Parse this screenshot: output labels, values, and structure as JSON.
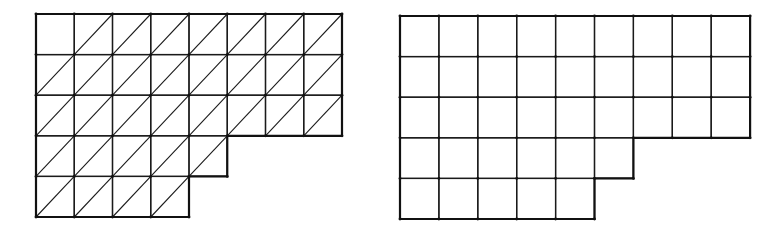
{
  "figure": {
    "colors": {
      "line": "#1a1a1a",
      "background": "#ffffff"
    }
  },
  "meshes": [
    {
      "id": "triangular-mesh",
      "type": "triangular",
      "origin": [
        36,
        14
      ],
      "cell_width": 38.25,
      "cell_height": 40.6,
      "rows": [
        8,
        8,
        8,
        5,
        4
      ],
      "diagonal_direction": "bottom-left-to-top-right",
      "cells_without_diagonal": [
        [
          0,
          0
        ]
      ]
    },
    {
      "id": "quadrilateral-mesh",
      "type": "quadrilateral",
      "origin": [
        400,
        16
      ],
      "cell_width": 38.9,
      "cell_height": 40.6,
      "rows": [
        9,
        9,
        9,
        6,
        5
      ]
    }
  ]
}
